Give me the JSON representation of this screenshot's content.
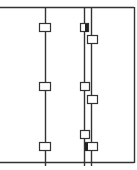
{
  "diagram": {
    "width": 137,
    "height": 170,
    "colors": {
      "stroke": "#333333",
      "background": "#ffffff",
      "node_fill": "#ffffff",
      "dark_fill": "#222222"
    },
    "frame": {
      "top_y": 7,
      "bottom_y": 162,
      "left_x": 0,
      "right_x": 134
    },
    "lines": [
      {
        "id": "line-1",
        "x": 45,
        "y1": 7,
        "y2": 166
      },
      {
        "id": "line-2",
        "x": 84,
        "y1": 7,
        "y2": 166
      },
      {
        "id": "line-3",
        "x": 91,
        "y1": 7,
        "y2": 166
      }
    ],
    "nodes": [
      {
        "line": "line-1",
        "x": 39,
        "y": 23,
        "w": 11,
        "h": 8
      },
      {
        "line": "line-1",
        "x": 39,
        "y": 82,
        "w": 11,
        "h": 8
      },
      {
        "line": "line-1",
        "x": 39,
        "y": 142,
        "w": 11,
        "h": 8
      },
      {
        "line": "line-2",
        "x": 80,
        "y": 23,
        "w": 8,
        "h": 8,
        "dark_band": {
          "x": 85,
          "w": 3
        }
      },
      {
        "line": "line-2",
        "x": 80,
        "y": 82,
        "w": 9,
        "h": 8
      },
      {
        "line": "line-2",
        "x": 80,
        "y": 130,
        "w": 9,
        "h": 8
      },
      {
        "line": "line-3",
        "x": 87,
        "y": 35,
        "w": 10,
        "h": 8
      },
      {
        "line": "line-3",
        "x": 87,
        "y": 95,
        "w": 10,
        "h": 8
      },
      {
        "line": "line-3",
        "x": 85,
        "y": 142,
        "w": 12,
        "h": 8,
        "dark_band": {
          "x": 85,
          "w": 3
        }
      }
    ]
  }
}
